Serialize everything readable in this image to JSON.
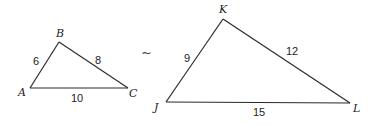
{
  "diagram": {
    "type": "similar-triangles",
    "similarity_symbol": "~",
    "triangle_small": {
      "vertices": [
        "A",
        "B",
        "C"
      ],
      "sides": [
        {
          "between": "AB",
          "label": "6"
        },
        {
          "between": "BC",
          "label": "8"
        },
        {
          "between": "AC",
          "label": "10"
        }
      ]
    },
    "triangle_large": {
      "vertices": [
        "J",
        "K",
        "L"
      ],
      "sides": [
        {
          "between": "JK",
          "label": "9"
        },
        {
          "between": "KL",
          "label": "12"
        },
        {
          "between": "JL",
          "label": "15"
        }
      ]
    }
  }
}
